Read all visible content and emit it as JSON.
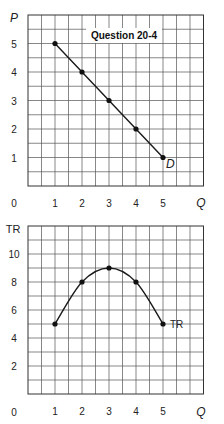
{
  "chart_data": [
    {
      "type": "line",
      "title": "Question 20-4",
      "xlabel": "Q",
      "ylabel": "P",
      "origin_label": "0",
      "xlim": [
        0,
        6.5
      ],
      "ylim": [
        0,
        6
      ],
      "x_ticks": [
        1,
        2,
        3,
        4,
        5
      ],
      "y_ticks": [
        1,
        2,
        3,
        4,
        5
      ],
      "grid": true,
      "grid_step_x": 0.5,
      "grid_step_y": 0.5,
      "series": [
        {
          "name": "D",
          "x": [
            1,
            2,
            3,
            4,
            5
          ],
          "values": [
            5,
            4,
            3,
            2,
            1
          ],
          "label_position": "end"
        }
      ]
    },
    {
      "type": "line",
      "title": "",
      "xlabel": "Q",
      "ylabel": "TR",
      "origin_label": "0",
      "xlim": [
        0,
        6.5
      ],
      "ylim": [
        0,
        12
      ],
      "x_ticks": [
        1,
        2,
        3,
        4,
        5
      ],
      "y_ticks": [
        2,
        4,
        6,
        8,
        10
      ],
      "grid": true,
      "grid_step_x": 0.5,
      "grid_step_y": 1,
      "series": [
        {
          "name": "TR",
          "x": [
            1,
            2,
            3,
            4,
            5
          ],
          "values": [
            5,
            8,
            9,
            8,
            5
          ],
          "smooth": true,
          "label_position": "end"
        }
      ]
    }
  ]
}
